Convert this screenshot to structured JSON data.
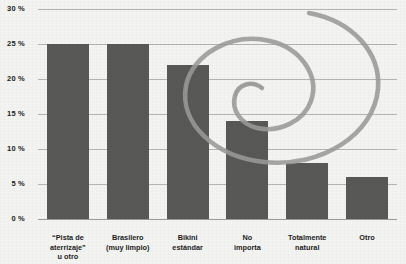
{
  "chart_data": {
    "type": "bar",
    "title": "",
    "subtitle": "",
    "xlabel": "",
    "ylabel": "",
    "categories": [
      "“Pista de\naterrizaje”\nu otro",
      "Brasilero\n(muy limpio)",
      "Bikini\nestándar",
      "No\nimporta",
      "Totalmente\nnatural",
      "Otro"
    ],
    "values": [
      25,
      25,
      22,
      14,
      8,
      6
    ],
    "ylim": [
      0,
      30
    ],
    "yticks": [
      0,
      5,
      10,
      15,
      20,
      25,
      30
    ],
    "ytick_labels": [
      "0 %",
      "5 %",
      "10 %",
      "15 %",
      "20 %",
      "25 %",
      "30 %"
    ],
    "grid": true,
    "legend": null,
    "value_suffix": "%",
    "annotations": [
      {
        "name": "hand-drawn-spiral",
        "type": "spiral",
        "description": "Gray hand-drawn spiral circling the Bikini estandar and No importa bars",
        "color": "#9a9a98"
      }
    ]
  },
  "colors": {
    "bar_fill": "#585856",
    "gridline": "#b4b4b2",
    "baseline": "#9a9a98",
    "background": "#f3f3f1",
    "text": "#1d1d1d",
    "annotation": "#9a9a98"
  }
}
